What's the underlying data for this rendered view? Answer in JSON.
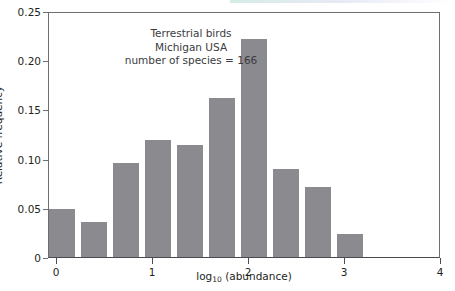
{
  "chart_data": {
    "type": "bar",
    "title": "",
    "subtitle": "",
    "xlabel": "log10 (abundance)",
    "xlabel_base": "log",
    "xlabel_sub": "10",
    "xlabel_rest": " (abundance)",
    "ylabel": "Relative frequency",
    "xlim": [
      -0.085,
      4.0
    ],
    "ylim": [
      0,
      0.25
    ],
    "grid": false,
    "legend": null,
    "bar_color": "#8a8a8f",
    "axis_color": "#6d6d72",
    "text_color": "#231f20",
    "annotation_color": "#3b3b41",
    "xticks": [
      0,
      1,
      2,
      3,
      4
    ],
    "xtick_labels": [
      "0",
      "1",
      "2",
      "3",
      "4"
    ],
    "yticks": [
      0,
      0.05,
      0.1,
      0.15,
      0.2,
      0.25
    ],
    "ytick_labels": [
      "0",
      "0.05",
      "0.10",
      "0.15",
      "0.20",
      "0.25"
    ],
    "bin_width": 0.333,
    "bin_starts": [
      -0.085,
      0.248,
      0.581,
      0.914,
      1.247,
      1.58,
      1.913,
      2.246,
      2.579,
      2.912
    ],
    "categories": [
      "-0.09–0.25",
      "0.25–0.58",
      "0.58–0.91",
      "0.91–1.25",
      "1.25–1.58",
      "1.58–1.91",
      "1.91–2.25",
      "2.25–2.58",
      "2.58–2.91",
      "2.91–3.25"
    ],
    "values": [
      0.049,
      0.036,
      0.096,
      0.119,
      0.114,
      0.162,
      0.222,
      0.089,
      0.071,
      0.023
    ],
    "annotation": {
      "line1": "Terrestrial birds",
      "line2": "Michigan USA",
      "line3": "number of species = 166"
    }
  }
}
